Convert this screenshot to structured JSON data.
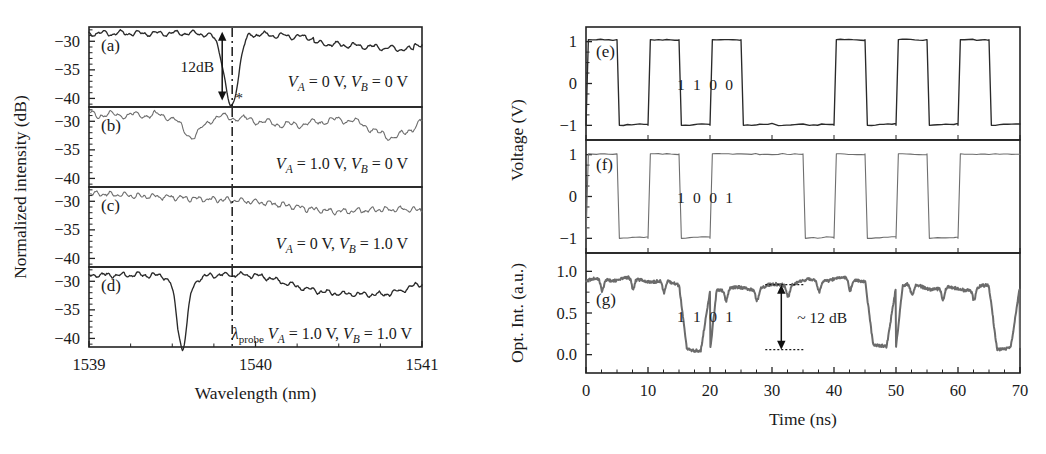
{
  "figure": {
    "background": "#ffffff",
    "ink": "#1a1a1a",
    "trace_color": "#3a3a3a",
    "noisy_trace_color": "#6b6b6b"
  },
  "left_panel": {
    "y_axis_title": "Normalized intensity (dB)",
    "x_axis_title": "Wavelength (nm)",
    "x_ticks": [
      "1539",
      "1540",
      "1541"
    ],
    "x_tick_values": [
      1539,
      1540,
      1541
    ],
    "x_minor_step": 0.25,
    "y_ticks": [
      "−30",
      "−35",
      "−40"
    ],
    "y_tick_values": [
      -30,
      -35,
      -40
    ],
    "xlim": [
      1539,
      1541
    ],
    "ylim": [
      -41.5,
      -27.5
    ],
    "probe_marker": {
      "label_lambda": "λ",
      "label_sub": "probe",
      "wavelength": 1539.86,
      "line_style": "dash-dot"
    },
    "dip_annotation": {
      "text": "12dB",
      "panel": "a",
      "from_db": -28.5,
      "to_db": -40.2
    },
    "asterisk_marker": "*",
    "subpanels": [
      {
        "letter": "(a)",
        "condition": "V_A = 0 V, V_B = 0 V",
        "condition_parts": {
          "v1_name": "V",
          "v1_sub": "A",
          "v1_value": "= 0 V,",
          "v2_name": "V",
          "v2_sub": "B",
          "v2_value": "= 0 V"
        },
        "has_deep_dip": true,
        "dip_center_nm": 1539.86,
        "dip_depth_db": -40.2,
        "baseline_db": -29.0
      },
      {
        "letter": "(b)",
        "condition": "V_A = 1.0 V, V_B = 0 V",
        "condition_parts": {
          "v1_name": "V",
          "v1_sub": "A",
          "v1_value": "= 1.0 V,",
          "v2_name": "V",
          "v2_sub": "B",
          "v2_value": "= 0 V"
        },
        "has_deep_dip": false,
        "dip_center_nm": 1539.62,
        "dip_depth_db": -33.2,
        "baseline_db": -29.2
      },
      {
        "letter": "(c)",
        "condition": "V_A = 0 V, V_B = 1.0 V",
        "condition_parts": {
          "v1_name": "V",
          "v1_sub": "A",
          "v1_value": "= 0 V,",
          "v2_name": "V",
          "v2_sub": "B",
          "v2_value": "= 1.0 V"
        },
        "has_deep_dip": false,
        "dip_center_nm": 1540.5,
        "dip_depth_db": -32.0,
        "baseline_db": -28.8
      },
      {
        "letter": "(d)",
        "condition": "V_A = 1.0 V, V_B = 1.0 V",
        "condition_parts": {
          "v1_name": "V",
          "v1_sub": "A",
          "v1_value": "= 1.0 V,",
          "v2_name": "V",
          "v2_sub": "B",
          "v2_value": "= 1.0 V"
        },
        "has_deep_dip": true,
        "dip_center_nm": 1539.56,
        "dip_depth_db": -40.3,
        "baseline_db": -29.3
      }
    ]
  },
  "right_panel": {
    "y_axis_title_voltage": "Voltage (V)",
    "y_axis_title_optical": "Opt. Int. (a.u.)",
    "x_axis_title": "Time (ns)",
    "x_ticks": [
      "0",
      "10",
      "20",
      "30",
      "40",
      "50",
      "60",
      "70"
    ],
    "x_tick_values": [
      0,
      10,
      20,
      30,
      40,
      50,
      60,
      70
    ],
    "x_minor_step": 2.5,
    "xlim": [
      0,
      70
    ],
    "voltage_y_ticks": [
      "1",
      "0",
      "−1"
    ],
    "voltage_y_tick_values": [
      1,
      0,
      -1
    ],
    "voltage_ylim": [
      -1.35,
      1.35
    ],
    "optical_y_ticks": [
      "1.0",
      "0.5",
      "0.0"
    ],
    "optical_y_tick_values": [
      1.0,
      0.5,
      0.0
    ],
    "optical_ylim": [
      -0.22,
      1.22
    ],
    "db_annotation": {
      "text": "~ 12 dB",
      "time_ns": 31.5,
      "top_level": 0.84,
      "bottom_level": 0.06
    },
    "subpanels": [
      {
        "letter": "(e)",
        "signal": "V_A",
        "bits_label": [
          "1",
          "1",
          "0",
          "0"
        ],
        "bit_label_times": [
          15.3,
          17.9,
          20.5,
          23.1
        ],
        "bit_period_ns": 5.0,
        "high_v": 1.05,
        "low_v": -1.0,
        "bit_sequence": [
          1,
          0,
          1,
          0,
          1,
          0,
          0,
          0,
          1,
          0,
          1,
          0,
          1,
          0
        ]
      },
      {
        "letter": "(f)",
        "signal": "V_B",
        "bits_label": [
          "1",
          "0",
          "0",
          "1"
        ],
        "bit_label_times": [
          15.3,
          17.9,
          20.5,
          23.1
        ],
        "bit_period_ns": 5.0,
        "high_v": 1.02,
        "low_v": -1.0,
        "bit_sequence": [
          1,
          0,
          1,
          0,
          1,
          1,
          1,
          0,
          1,
          0,
          1,
          0,
          1,
          1
        ]
      },
      {
        "letter": "(g)",
        "signal": "Optical output",
        "bits_label": [
          "1",
          "1",
          "0",
          "1"
        ],
        "bit_label_times": [
          15.3,
          17.9,
          20.5,
          23.1
        ],
        "bit_period_ns": 5.0,
        "high_level": 0.85,
        "low_level": 0.08,
        "bit_sequence": [
          1,
          1,
          1,
          0,
          1,
          1,
          1,
          1,
          1,
          0,
          1,
          1,
          1,
          0
        ]
      }
    ]
  }
}
